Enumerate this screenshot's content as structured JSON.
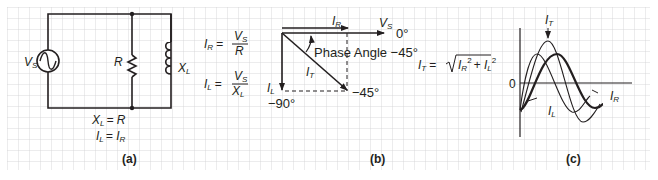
{
  "panel_a": {
    "caption": "(a)",
    "source_label": "V",
    "source_sub": "S",
    "resistor_label": "R",
    "inductor_label": "X",
    "inductor_sub": "L",
    "eq1_lhs": "X",
    "eq1_lhs_sub": "L",
    "eq1_rhs": "= R",
    "eq2_lhs": "I",
    "eq2_lhs_sub": "L",
    "eq2_mid": "= I",
    "eq2_rhs_sub": "R"
  },
  "formulas": {
    "ir_lhs": "I",
    "ir_lhs_sub": "R",
    "ir_eq": "=",
    "ir_num": "V",
    "ir_num_sub": "S",
    "ir_den": "R",
    "il_lhs": "I",
    "il_lhs_sub": "L",
    "il_eq": "=",
    "il_num": "V",
    "il_num_sub": "S",
    "il_den": "X",
    "il_den_sub": "L"
  },
  "panel_b": {
    "caption": "(b)",
    "ir_label": "I",
    "ir_sub": "R",
    "vs_label": "V",
    "vs_sub": "S",
    "zero_deg": "0°",
    "phase_angle": "Phase Angle −45°",
    "it_label": "I",
    "it_sub": "T",
    "il_label": "I",
    "il_sub": "L",
    "minus90": "−90°",
    "minus45": "−45°"
  },
  "it_formula": {
    "lhs": "I",
    "lhs_sub": "T",
    "eq": "=",
    "radicand_a": "I",
    "radicand_a_sub": "R",
    "plus": "+ I",
    "radicand_b_sub": "L",
    "exp": "2"
  },
  "panel_c": {
    "caption": "(c)",
    "zero": "0",
    "it_label": "I",
    "it_sub": "T",
    "il_label": "I",
    "il_sub": "L",
    "ir_label": "I",
    "ir_sub": "R"
  },
  "colors": {
    "grid": "#cfd0d2",
    "ink": "#231f20"
  }
}
